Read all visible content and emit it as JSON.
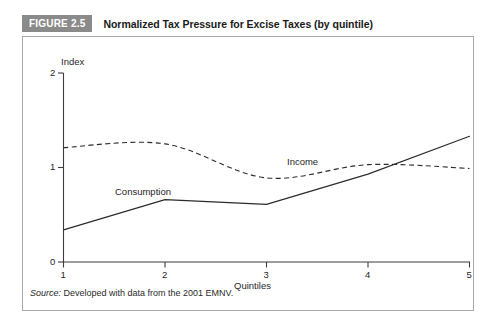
{
  "figure": {
    "badge_label": "FIGURE 2.5",
    "title": "Normalized Tax Pressure for Excise Taxes (by quintile)",
    "badge_color": "#8a8a8a",
    "badge_text_color": "#ffffff"
  },
  "source": {
    "prefix": "Source:",
    "text": " Developed with data from the 2001 EMNV."
  },
  "axes": {
    "y_title": "Index",
    "x_title": "Quintiles",
    "y_ticks": [
      "0",
      "1",
      "2"
    ],
    "x_ticks": [
      "1",
      "2",
      "3",
      "4",
      "5"
    ]
  },
  "series_labels": {
    "consumption": "Consumption",
    "income": "Income"
  },
  "chart_data": {
    "type": "line",
    "title": "Normalized Tax Pressure for Excise Taxes (by quintile)",
    "xlabel": "Quintiles",
    "ylabel": "Index",
    "x": [
      1,
      2,
      3,
      4,
      5
    ],
    "xlim": [
      1,
      5
    ],
    "ylim": [
      0,
      2
    ],
    "yticks": [
      0,
      1,
      2
    ],
    "xticks": [
      1,
      2,
      3,
      4,
      5
    ],
    "grid": false,
    "legend": "inline-annotations",
    "series": [
      {
        "name": "Income",
        "style": "dashed",
        "smoothed": true,
        "color": "#2b2b2b",
        "values": [
          1.21,
          1.25,
          0.89,
          1.03,
          0.99
        ]
      },
      {
        "name": "Consumption",
        "style": "solid",
        "smoothed": false,
        "color": "#2b2b2b",
        "values": [
          0.34,
          0.66,
          0.61,
          0.93,
          1.33
        ]
      }
    ],
    "annotations": [
      {
        "text": "Income",
        "x": 3.45,
        "y": 1.12
      },
      {
        "text": "Consumption",
        "x": 1.62,
        "y": 0.78
      }
    ],
    "source": "Developed with data from the 2001 EMNV."
  }
}
